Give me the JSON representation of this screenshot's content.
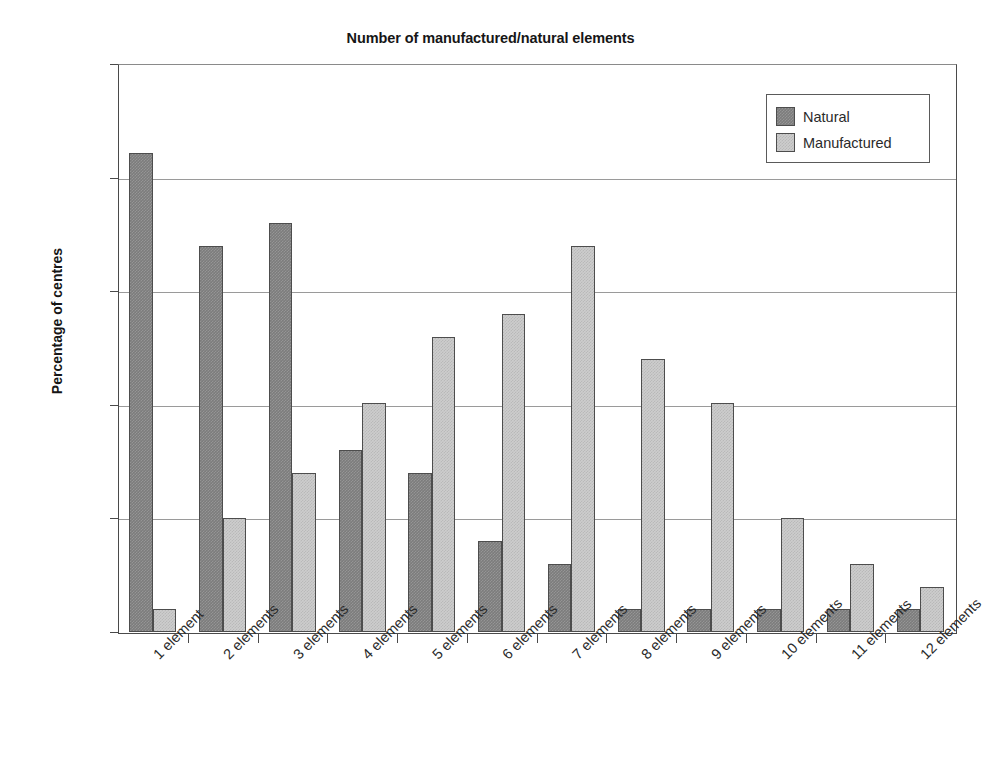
{
  "chart_data": {
    "type": "bar",
    "title": "Number of manufactured/natural elements",
    "xlabel": "",
    "ylabel": "Percentage of centres",
    "categories": [
      "1 element",
      "2 elements",
      "3 elements",
      "4 elements",
      "5 elements",
      "6 elements",
      "7 elements",
      "8 elements",
      "9 elements",
      "10 elements",
      "11 elements",
      "12 elements"
    ],
    "series": [
      {
        "name": "Natural",
        "color": "#7c7c7c",
        "values": [
          21.1,
          17,
          18,
          8,
          7,
          4,
          3,
          1,
          1,
          1,
          1,
          1
        ]
      },
      {
        "name": "Manufactured",
        "color": "#cdcdcd",
        "values": [
          1,
          5,
          7,
          10.1,
          13,
          14,
          17,
          12,
          10.1,
          5,
          3,
          2
        ]
      }
    ],
    "ylim": [
      0,
      25
    ],
    "ytick_values": [
      0,
      5,
      10,
      15,
      20,
      25
    ],
    "ytick_labels": [
      "0%",
      "5%",
      "10%",
      "15%",
      "20%",
      "25%"
    ],
    "grid": true,
    "legend_position": "top-right"
  },
  "legend": {
    "entries": [
      {
        "label": "Natural"
      },
      {
        "label": "Manufactured"
      }
    ]
  }
}
